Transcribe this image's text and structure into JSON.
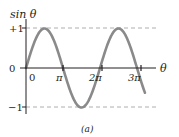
{
  "figure": {
    "y_axis_label": "sin θ",
    "x_axis_label": "θ",
    "caption": "(a)",
    "y_ticks": [
      {
        "label": "+1",
        "value": 1
      },
      {
        "label": "0",
        "value": 0
      },
      {
        "label": "−1",
        "value": -1
      }
    ],
    "x_ticks": [
      {
        "label": "0",
        "value": 0
      },
      {
        "label": "π",
        "value": 3.14159
      },
      {
        "label": "2π",
        "value": 6.28318
      },
      {
        "label": "3π",
        "value": 9.42478
      }
    ],
    "colors": {
      "curve": "#8a8a8a",
      "axes": "#231f20",
      "dashed": "#9a9a9a"
    }
  },
  "chart_data": {
    "type": "line",
    "title": "",
    "xlabel": "θ",
    "ylabel": "sin θ",
    "ylim": [
      -1,
      1
    ],
    "xlim": [
      0,
      10.1
    ],
    "grid": false,
    "reference_lines": [
      1,
      -1
    ],
    "series": [
      {
        "name": "sin θ",
        "function": "sin(theta)",
        "x": [
          0,
          1.571,
          3.142,
          4.712,
          6.283,
          7.854,
          9.425,
          10.05
        ],
        "values": [
          0,
          1,
          0,
          -1,
          0,
          1,
          0,
          -0.59
        ]
      }
    ]
  }
}
